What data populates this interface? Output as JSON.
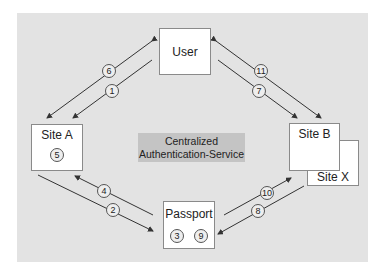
{
  "diagram": {
    "title": "Centralized Authentication-Service",
    "center_label_line1": "Centralized",
    "center_label_line2": "Authentication-Service",
    "colors": {
      "panel": "#e3e3e3",
      "center_box": "#c4c4c4",
      "node_fill": "#ffffff",
      "line": "#333333"
    },
    "nodes": {
      "user": {
        "label": "User"
      },
      "site_a": {
        "label": "Site A",
        "steps": [
          "5"
        ]
      },
      "site_b": {
        "label": "Site B"
      },
      "site_x": {
        "label": "Site X"
      },
      "passport": {
        "label": "Passport",
        "steps": [
          "3",
          "9"
        ]
      }
    },
    "edges": [
      {
        "step": "1",
        "from": "User",
        "to": "Site A"
      },
      {
        "step": "2",
        "from": "Site A",
        "to": "Passport"
      },
      {
        "step": "3",
        "at": "Passport"
      },
      {
        "step": "4",
        "from": "Passport",
        "to": "Site A"
      },
      {
        "step": "5",
        "at": "Site A"
      },
      {
        "step": "6",
        "from": "Site A",
        "to": "User"
      },
      {
        "step": "7",
        "from": "User",
        "to": "Site B"
      },
      {
        "step": "8",
        "from": "Site B",
        "to": "Passport"
      },
      {
        "step": "9",
        "at": "Passport"
      },
      {
        "step": "10",
        "from": "Passport",
        "to": "Site B"
      },
      {
        "step": "11",
        "from": "Site B",
        "to": "User"
      }
    ],
    "step_labels": {
      "s1": "1",
      "s2": "2",
      "s3": "3",
      "s4": "4",
      "s5": "5",
      "s6": "6",
      "s7": "7",
      "s8": "8",
      "s9": "9",
      "s10": "10",
      "s11": "11"
    }
  }
}
